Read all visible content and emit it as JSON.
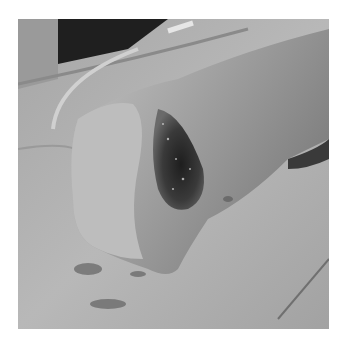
{
  "image": {
    "kind": "grayscale clinical photograph",
    "subject": "limb with open wound resting on surgical drape",
    "frame": {
      "x": 18,
      "y": 19,
      "width": 311,
      "height": 310
    },
    "background_color": "#ffffff",
    "tones": {
      "drape": "#b4b4b4",
      "drape_shadow": "#8e8e8e",
      "skin": "#9c9c9c",
      "skin_light": "#c8c8c8",
      "wound_dark": "#2e2e2e",
      "top_dark": "#1c1c1c"
    }
  }
}
